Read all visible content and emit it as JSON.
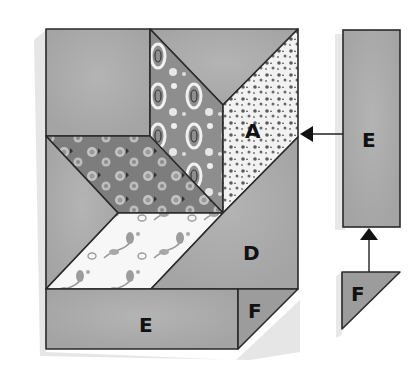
{
  "diagram": {
    "type": "quilt-block-assembly",
    "colors": {
      "background": "#ffffff",
      "shadow": "#e4e4e4",
      "solid_gray": "#a9a9a9",
      "solid_gray_light": "#b0b0b0",
      "dark_floral": "#7d7d7d",
      "paisley": "#8e8e8e",
      "speckled": "#f2f2f2",
      "white_floral": "#f7f7f7",
      "outline": "#2a2a2a",
      "label": "#111111"
    },
    "main_block": {
      "pieces": [
        {
          "id": "top-left-square",
          "label": ""
        },
        {
          "id": "top-center-triangle",
          "label": ""
        },
        {
          "id": "paisley-parallelogram",
          "label": ""
        },
        {
          "id": "speckled-parallelogram",
          "label": "A"
        },
        {
          "id": "dark-floral-parallelogram",
          "label": ""
        },
        {
          "id": "left-triangle",
          "label": ""
        },
        {
          "id": "white-floral-parallelogram",
          "label": ""
        },
        {
          "id": "large-triangle",
          "label": "D"
        },
        {
          "id": "bottom-rectangle",
          "label": "E"
        },
        {
          "id": "corner-triangle",
          "label": "F"
        }
      ]
    },
    "loose_pieces": [
      {
        "id": "side-rectangle",
        "label": "E"
      },
      {
        "id": "side-triangle",
        "label": "F"
      }
    ],
    "arrows": [
      {
        "from": "side-rectangle",
        "to": "main-block",
        "direction": "left"
      },
      {
        "from": "side-triangle",
        "to": "side-rectangle",
        "direction": "up"
      }
    ]
  }
}
